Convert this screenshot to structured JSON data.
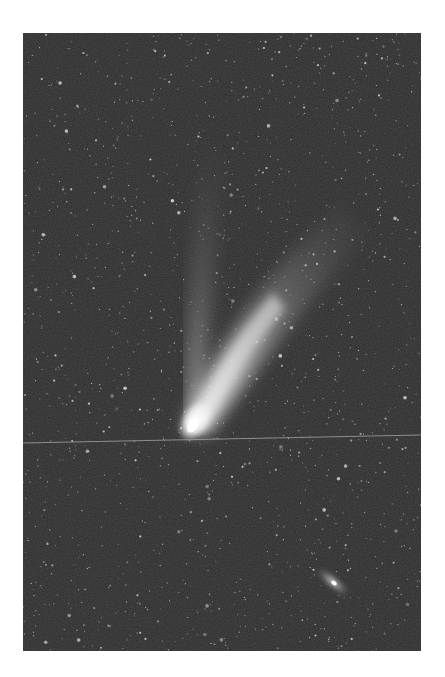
{
  "image": {
    "subject": "Comet with two tails against star field",
    "background_color": "#2b2b2b",
    "frame_color": "#ffffff",
    "elements": {
      "comet_head": {
        "x": 170,
        "y": 390
      },
      "ion_tail": "narrow tail extending upward",
      "dust_tail": "broad tail fanning up and right",
      "galaxy": {
        "x": 310,
        "y": 549
      },
      "satellite_trail": "faint line crossing horizontally"
    }
  }
}
